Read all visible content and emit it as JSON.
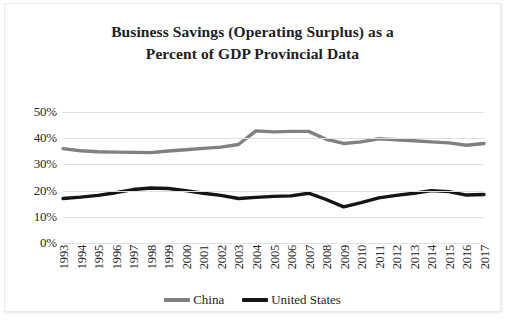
{
  "chart_data": {
    "type": "line",
    "title": "Business Savings (Operating Surplus) as a Percent of GDP Provincial Data",
    "title_line1": "Business Savings (Operating Surplus) as a",
    "title_line2": "Percent of GDP Provincial Data",
    "xlabel": "",
    "ylabel": "",
    "ylim": [
      0,
      50
    ],
    "y_ticks": [
      "0%",
      "10%",
      "20%",
      "30%",
      "40%",
      "50%"
    ],
    "y_tick_values": [
      0,
      10,
      20,
      30,
      40,
      50
    ],
    "grid": true,
    "legend_position": "bottom",
    "categories": [
      "1993",
      "1994",
      "1995",
      "1996",
      "1997",
      "1998",
      "1999",
      "2000",
      "2001",
      "2002",
      "2003",
      "2004",
      "2005",
      "2006",
      "2007",
      "2008",
      "2009",
      "2010",
      "2011",
      "2012",
      "2013",
      "2014",
      "2015",
      "2016",
      "2017"
    ],
    "series": [
      {
        "name": "China",
        "color": "#808080",
        "values": [
          36.0,
          35.2,
          34.8,
          34.7,
          34.6,
          34.5,
          35.1,
          35.6,
          36.1,
          36.6,
          37.6,
          42.8,
          42.4,
          42.6,
          42.6,
          39.6,
          38.0,
          38.6,
          39.8,
          39.4,
          39.0,
          38.6,
          38.2,
          37.3,
          38.0
        ]
      },
      {
        "name": "United States",
        "color": "#151515",
        "values": [
          17.0,
          17.5,
          18.2,
          19.2,
          20.4,
          21.0,
          20.8,
          20.0,
          19.0,
          18.2,
          17.0,
          17.4,
          17.8,
          18.0,
          19.0,
          16.6,
          13.8,
          15.4,
          17.2,
          18.2,
          19.0,
          20.0,
          19.6,
          18.3,
          18.5
        ]
      }
    ]
  },
  "legend": {
    "items": [
      {
        "label": "China",
        "color": "#808080"
      },
      {
        "label": "United States",
        "color": "#151515"
      }
    ]
  }
}
